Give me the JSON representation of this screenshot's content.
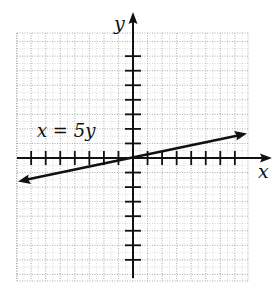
{
  "chart_data": {
    "type": "line",
    "title": "",
    "xlabel": "x",
    "ylabel": "y",
    "equation": "x = 5y",
    "series": [
      {
        "name": "x = 5y",
        "slope": 0.2,
        "intercept": 0,
        "x": [
          -7.9,
          0,
          7.8
        ],
        "y": [
          -1.58,
          0,
          1.56
        ]
      }
    ],
    "xlim": [
      -8,
      8
    ],
    "ylim": [
      -8.4,
      8.6
    ],
    "ticks_per_side": 7,
    "tick_labels": false,
    "grid": true,
    "grid_style": "dotted, 1 unit major with half-unit minor"
  },
  "labels": {
    "x_axis": "x",
    "y_axis": "y",
    "equation": "x = 5y"
  },
  "colors": {
    "axis": "#111111",
    "line": "#111111",
    "grid": "#9a9a9a",
    "background": "#ffffff"
  }
}
